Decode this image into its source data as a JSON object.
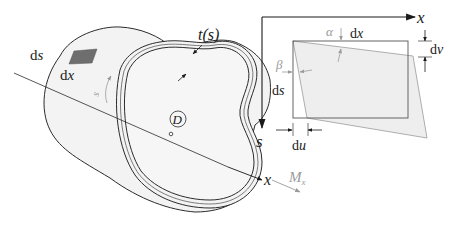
{
  "figure": {
    "colors": {
      "line": "#2b2b2b",
      "tube_fill": "#f3f3f3",
      "element_patch": "#6e6e6e",
      "deformed_fill": "#ededed",
      "gray_annotation": "#9a9a9a"
    }
  },
  "tube": {
    "element_label_s": "ds",
    "element_label_x": "dx",
    "thickness_label": "t(s)",
    "arc_label": "s",
    "center_label": "D",
    "axis_label": "x",
    "moment_label": "M",
    "moment_subscript": "x"
  },
  "element_detail": {
    "axis_x_label": "x",
    "axis_s_label": "s",
    "top_dimension": "dx",
    "right_dimension": "dv",
    "left_dimension": "ds",
    "bottom_dimension": "du",
    "angle_alpha": "α",
    "angle_beta": "β"
  }
}
